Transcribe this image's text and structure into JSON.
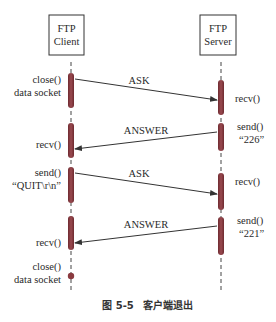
{
  "diagram": {
    "type": "sequence",
    "participants": [
      {
        "id": "client",
        "line1": "FTP",
        "line2": "Client"
      },
      {
        "id": "server",
        "line1": "FTP",
        "line2": "Server"
      }
    ],
    "messages": [
      {
        "label": "ASK",
        "from": "client",
        "to": "server"
      },
      {
        "label": "ANSWER",
        "from": "server",
        "to": "client"
      },
      {
        "label": "ASK",
        "from": "client",
        "to": "server"
      },
      {
        "label": "ANSWER",
        "from": "server",
        "to": "client"
      }
    ],
    "client_notes": [
      {
        "line1": "close()",
        "line2": "data socket"
      },
      {
        "line1": "recv()"
      },
      {
        "line1": "send()",
        "line2": "“QUIT\\r\\n”"
      },
      {
        "line1": "recv()"
      },
      {
        "line1": "close()",
        "line2": "data socket"
      }
    ],
    "server_notes": [
      {
        "line1": "recv()"
      },
      {
        "line1": "send()",
        "line2": "“226”"
      },
      {
        "line1": "recv()"
      },
      {
        "line1": "send()",
        "line2": "“221”"
      }
    ],
    "caption": {
      "figure": "图 5-5",
      "title": "客户端退出"
    },
    "colors": {
      "activation": "#8a3a3f",
      "line": "#333333",
      "box_border": "#333333"
    }
  }
}
